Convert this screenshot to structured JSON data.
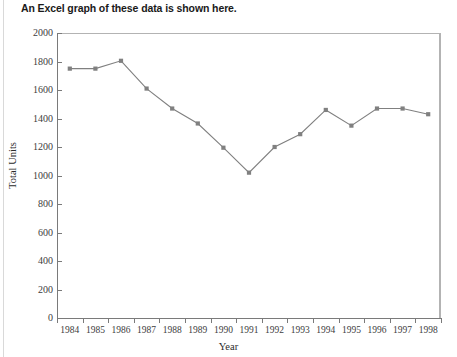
{
  "caption": "An Excel graph of these data is shown here.",
  "chart_data": {
    "type": "line",
    "title": "",
    "xlabel": "Year",
    "ylabel": "Total Units",
    "categories": [
      "1984",
      "1985",
      "1986",
      "1987",
      "1988",
      "1989",
      "1990",
      "1991",
      "1992",
      "1993",
      "1994",
      "1995",
      "1996",
      "1997",
      "1998"
    ],
    "values": [
      1750,
      1750,
      1805,
      1610,
      1470,
      1365,
      1195,
      1020,
      1200,
      1290,
      1460,
      1350,
      1470,
      1470,
      1430
    ],
    "series": [
      {
        "name": "Total Units",
        "values": [
          1750,
          1750,
          1805,
          1610,
          1470,
          1365,
          1195,
          1020,
          1200,
          1290,
          1460,
          1350,
          1470,
          1470,
          1430
        ]
      }
    ],
    "ylim": [
      0,
      2000
    ],
    "yticks": [
      0,
      200,
      400,
      600,
      800,
      1000,
      1200,
      1400,
      1600,
      1800,
      2000
    ],
    "ytick_labels": [
      "0",
      "200",
      "400",
      "600",
      "800",
      "1000",
      "1200",
      "1400",
      "1600",
      "1800",
      "2000"
    ],
    "grid": false,
    "legend": "none",
    "marker": "square",
    "line_color": "#808080",
    "marker_color": "#808080",
    "frame_color": "#b3b3b3",
    "axis_color": "#7a7a7a"
  }
}
